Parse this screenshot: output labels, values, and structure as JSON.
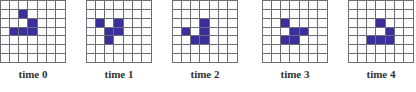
{
  "figure": {
    "grid_rows": 7,
    "grid_cols": 7,
    "fill_color": "#3b2f9c",
    "line_color": "#6e6e7a",
    "panels": [
      {
        "label": "time 0",
        "left": 0,
        "cells": [
          [
            1,
            2
          ],
          [
            2,
            3
          ],
          [
            3,
            1
          ],
          [
            3,
            2
          ],
          [
            3,
            3
          ]
        ]
      },
      {
        "label": "time 1",
        "left": 86,
        "cells": [
          [
            2,
            1
          ],
          [
            2,
            3
          ],
          [
            3,
            2
          ],
          [
            3,
            3
          ],
          [
            4,
            2
          ]
        ]
      },
      {
        "label": "time 2",
        "left": 172,
        "cells": [
          [
            2,
            3
          ],
          [
            3,
            1
          ],
          [
            3,
            3
          ],
          [
            4,
            2
          ],
          [
            4,
            3
          ]
        ]
      },
      {
        "label": "time 3",
        "left": 262,
        "cells": [
          [
            2,
            2
          ],
          [
            3,
            3
          ],
          [
            3,
            4
          ],
          [
            4,
            2
          ],
          [
            4,
            3
          ]
        ]
      },
      {
        "label": "time 4",
        "left": 348,
        "cells": [
          [
            2,
            3
          ],
          [
            3,
            4
          ],
          [
            4,
            2
          ],
          [
            4,
            3
          ],
          [
            4,
            4
          ]
        ]
      }
    ]
  }
}
